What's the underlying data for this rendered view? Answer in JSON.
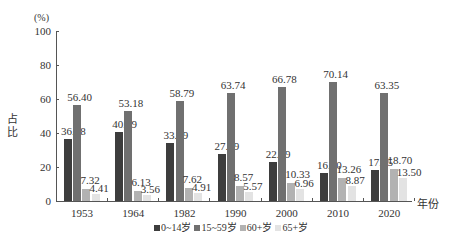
{
  "chart_data": {
    "type": "bar",
    "title": "",
    "ylabel": "占比",
    "yunit": "(%)",
    "xlabel": "年份",
    "ylim": [
      0,
      100
    ],
    "yticks": [
      0,
      20,
      40,
      60,
      80,
      100
    ],
    "grid": false,
    "legend_position": "bottom",
    "categories": [
      "1953",
      "1964",
      "1982",
      "1990",
      "2000",
      "2010",
      "2020"
    ],
    "series": [
      {
        "name": "0~14岁",
        "color": "#3d3d3d",
        "values": [
          36.28,
          40.69,
          33.89,
          27.69,
          22.89,
          16.6,
          17.95
        ]
      },
      {
        "name": "15~59岁",
        "color": "#707070",
        "values": [
          56.4,
          53.18,
          58.79,
          63.74,
          66.78,
          70.14,
          63.35
        ]
      },
      {
        "name": "60+岁",
        "color": "#b2b2b2",
        "values": [
          7.32,
          6.13,
          7.62,
          8.57,
          10.33,
          13.26,
          18.7
        ]
      },
      {
        "name": "65+岁",
        "color": "#e3e3e3",
        "values": [
          4.41,
          3.56,
          4.91,
          5.57,
          6.96,
          8.87,
          13.5
        ]
      }
    ],
    "value_labels": [
      [
        "36.28",
        "40.69",
        "33.89",
        "27.69",
        "22.89",
        "16.60",
        "17.95"
      ],
      [
        "56.40",
        "53.18",
        "58.79",
        "63.74",
        "66.78",
        "70.14",
        "63.35"
      ],
      [
        "7.32",
        "6.13",
        "7.62",
        "8.57",
        "10.33",
        "13.26",
        "18.70"
      ],
      [
        "4.41",
        "3.56",
        "4.91",
        "5.57",
        "6.96",
        "8.87",
        "13.50"
      ]
    ]
  },
  "axis": {
    "unit": "(%)",
    "ylabel": "占\n比",
    "xlabel": "年份",
    "yticks": [
      "0",
      "20",
      "40",
      "60",
      "80",
      "100"
    ]
  },
  "legend": [
    {
      "label": "0~14岁",
      "color": "#3d3d3d"
    },
    {
      "label": "15~59岁",
      "color": "#707070"
    },
    {
      "label": "60+岁",
      "color": "#b2b2b2"
    },
    {
      "label": "65+岁",
      "color": "#e3e3e3"
    }
  ]
}
